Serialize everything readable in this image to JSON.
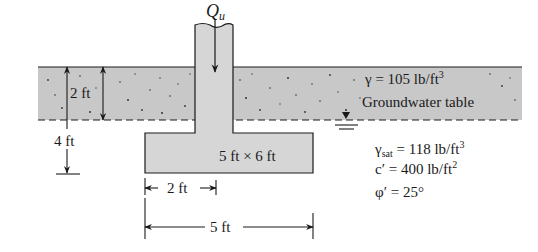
{
  "figure": {
    "load_label": "Q",
    "load_subscript": "u",
    "upper_layer": {
      "unit_weight_label": "γ = 105 lb/ft",
      "unit_weight_exp": "3",
      "groundwater_label": "Groundwater table"
    },
    "lower_layer": {
      "gamma_sat_symbol": "γ",
      "gamma_sat_sub": "sat",
      "gamma_sat_value": " = 118 lb/ft",
      "gamma_sat_exp": "3",
      "cohesion_label": "c′ = 400 lb/ft",
      "cohesion_exp": "2",
      "friction_label": "φ′ = 25°"
    },
    "dimensions": {
      "depth_water": "2 ft",
      "depth_footing": "4 ft",
      "footing_size": "5 ft × 6 ft",
      "column_width": "2 ft",
      "footing_width": "5 ft"
    },
    "colors": {
      "soil_fill": "#c8c8c8",
      "concrete_fill": "#d6d6d6",
      "line": "#1a1a1a"
    }
  }
}
